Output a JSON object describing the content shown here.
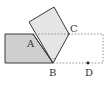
{
  "diagram": {
    "type": "geometry",
    "colors": {
      "rectangle_fill": "#cfcfcf",
      "folded_fill": "#e6e6e6",
      "stroke": "#3a3a3a",
      "dashed": "#888888",
      "background": "#ffffff"
    },
    "points": {
      "A": {
        "label": "A",
        "x": 33,
        "y": 34
      },
      "B": {
        "label": "B",
        "x": 53,
        "y": 63
      },
      "C": {
        "label": "C",
        "x": 69,
        "y": 34
      },
      "D": {
        "label": "D",
        "x": 88,
        "y": 63
      }
    },
    "labels": {
      "A": "A",
      "B": "B",
      "C": "C",
      "D": "D"
    }
  }
}
